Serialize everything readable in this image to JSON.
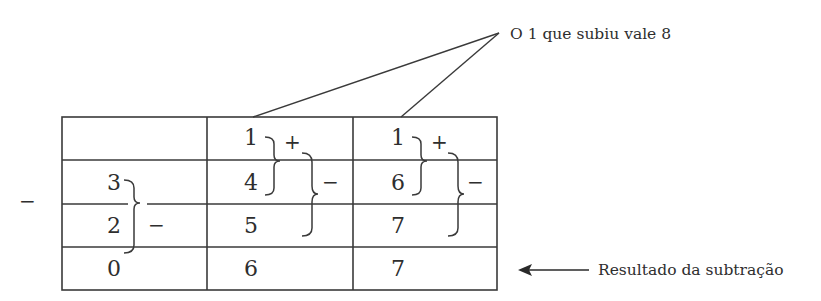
{
  "annotations": {
    "top_label": "O 1 que subiu vale 8",
    "result_label": "Resultado da subtração"
  },
  "outer_operator": "−",
  "table": {
    "columns": 3,
    "rows": [
      [
        "",
        "1",
        "1"
      ],
      [
        "3",
        "4",
        "6"
      ],
      [
        "2",
        "5",
        "7"
      ],
      [
        "0",
        "6",
        "7"
      ]
    ]
  },
  "operators": {
    "col1_minus": "−",
    "col2_plus": "+",
    "col2_minus": "−",
    "col3_plus": "+",
    "col3_minus": "−"
  },
  "colors": {
    "line": "#3a3a3a",
    "text": "#2e2e2e",
    "background": "#ffffff"
  }
}
